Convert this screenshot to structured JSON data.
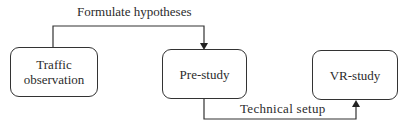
{
  "diagram": {
    "nodes": [
      {
        "id": "traffic",
        "label_line1": "Traffic",
        "label_line2": "observation"
      },
      {
        "id": "pre",
        "label": "Pre-study"
      },
      {
        "id": "vr",
        "label": "VR-study"
      }
    ],
    "edges": [
      {
        "from": "traffic",
        "to": "pre",
        "label": "Formulate hypotheses"
      },
      {
        "from": "pre",
        "to": "vr",
        "label": "Technical setup"
      }
    ]
  },
  "colors": {
    "stroke": "#333333",
    "text": "#2b2b2b",
    "background": "#ffffff"
  }
}
